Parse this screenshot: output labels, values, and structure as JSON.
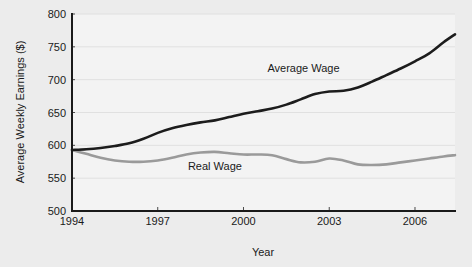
{
  "chart_data": {
    "type": "line",
    "title": "",
    "xlabel": "Year",
    "ylabel": "Average Weekly Earnings ($)",
    "xlim": [
      1994,
      2007.4
    ],
    "ylim": [
      500,
      800
    ],
    "grid": true,
    "legend_position": "inline-annotation",
    "y_ticks": [
      500,
      550,
      600,
      650,
      700,
      750,
      800
    ],
    "y_ticklabels": [
      "500",
      "550",
      "600",
      "650",
      "700",
      "750",
      "800"
    ],
    "x_ticks": [
      1994,
      1997,
      2000,
      2003,
      2006
    ],
    "x_ticklabels": [
      "1994",
      "1997",
      "2000",
      "2003",
      "2006"
    ],
    "x": [
      1994,
      1994.5,
      1995,
      1995.5,
      1996,
      1996.5,
      1997,
      1997.5,
      1998,
      1998.5,
      1999,
      1999.5,
      2000,
      2000.5,
      2001,
      2001.5,
      2002,
      2002.5,
      2003,
      2003.5,
      2004,
      2004.5,
      2005,
      2005.5,
      2006,
      2006.5,
      2007,
      2007.4
    ],
    "series": [
      {
        "name": "Average Wage",
        "color": "#1c1c1c",
        "values": [
          593,
          594,
          596,
          599,
          603,
          610,
          619,
          626,
          631,
          635,
          638,
          643,
          648,
          652,
          656,
          662,
          670,
          678,
          682,
          683,
          688,
          697,
          707,
          717,
          728,
          740,
          757,
          769
        ]
      },
      {
        "name": "Real Wage",
        "color": "#9a9a9a",
        "values": [
          593,
          587,
          581,
          577,
          575,
          575,
          577,
          581,
          586,
          589,
          590,
          588,
          586,
          586,
          585,
          579,
          574,
          575,
          580,
          577,
          571,
          570,
          571,
          574,
          577,
          580,
          583,
          585
        ]
      }
    ],
    "annotations": [
      {
        "text": "Average Wage",
        "x": 2002.1,
        "y": 712
      },
      {
        "text": "Real Wage",
        "x": 1999.0,
        "y": 563
      }
    ]
  },
  "colors": {
    "background": "#ececec",
    "plot_background": "#f3f3f3",
    "axis": "#1a1a1a",
    "gridline": "#e0e0e0",
    "average_wage": "#1c1c1c",
    "real_wage": "#9a9a9a"
  }
}
